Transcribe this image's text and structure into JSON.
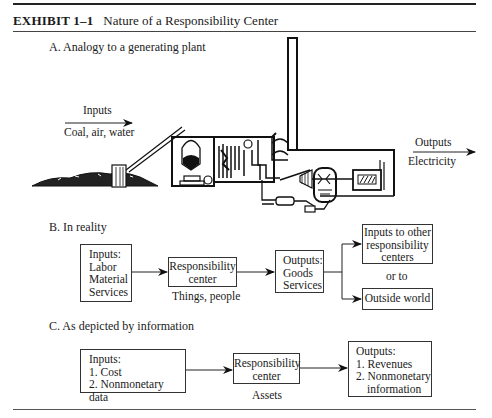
{
  "header": {
    "exhibit_label": "EXHIBIT  1–1",
    "title": "Nature of a Responsibility Center"
  },
  "section_a": {
    "heading": "A.  Analogy to a generating plant",
    "inputs_label": "Inputs",
    "inputs_detail": "Coal, air, water",
    "outputs_label": "Outputs",
    "outputs_detail": "Electricity"
  },
  "section_b": {
    "heading": "B.  In reality",
    "inputs_box": [
      "Inputs:",
      "Labor",
      "Material",
      "Services"
    ],
    "center_box": [
      "Responsibility",
      "center"
    ],
    "center_caption": "Things, people",
    "outputs_box": [
      "Outputs:",
      "Goods",
      "Services"
    ],
    "dest_top": [
      "Inputs to other",
      "responsibility",
      "centers"
    ],
    "or_to": "or to",
    "dest_bottom": "Outside world"
  },
  "section_c": {
    "heading": "C.  As depicted by information",
    "inputs_box": [
      "Inputs:",
      "1.  Cost",
      "2.  Nonmonetary data"
    ],
    "center_box": [
      "Responsibility",
      "center"
    ],
    "center_caption": "Assets",
    "outputs_box": [
      "Outputs:",
      "1.  Revenues",
      "2.  Nonmonetary",
      "information"
    ]
  }
}
